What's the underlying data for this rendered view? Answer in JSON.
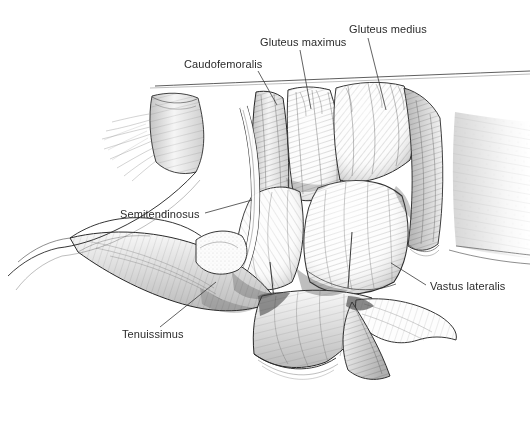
{
  "figure": {
    "medium": "pen-and-ink anatomical illustration",
    "background_color": "#ffffff",
    "ink_color": "#2a2a2a",
    "label_color": "#2b2b2b",
    "label_font_size_px": 11,
    "canvas": {
      "width": 530,
      "height": 421
    }
  },
  "labels": [
    {
      "id": "caudofemoralis",
      "text": "Caudofemoralis",
      "text_x": 184,
      "text_y": 68,
      "anchor": "start",
      "leader": "M258,71 L277,105",
      "target_structure": "caudofemoralis muscle belly"
    },
    {
      "id": "gluteus-maximus",
      "text": "Gluteus maximus",
      "text_x": 260,
      "text_y": 46,
      "anchor": "start",
      "leader": "M300,50 L311,109",
      "target_structure": "gluteus maximus muscle belly"
    },
    {
      "id": "gluteus-medius",
      "text": "Gluteus medius",
      "text_x": 349,
      "text_y": 33,
      "anchor": "start",
      "leader": "M368,38 L386,110",
      "target_structure": "gluteus medius muscle belly"
    },
    {
      "id": "semitendinosus",
      "text": "Semitendinosus",
      "text_x": 120,
      "text_y": 218,
      "anchor": "start",
      "leader": "M205,213 L252,200",
      "target_structure": "semitendinosus muscle"
    },
    {
      "id": "tenuissimus",
      "text": "Tenuissimus",
      "text_x": 122,
      "text_y": 338,
      "anchor": "start",
      "leader": "M160,327 L216,282",
      "target_structure": "tenuissimus muscle strap"
    },
    {
      "id": "vastus-lateralis",
      "text": "Vastus lateralis",
      "text_x": 430,
      "text_y": 290,
      "anchor": "start",
      "leader": "M426,285 L391,263",
      "target_structure": "vastus lateralis muscle"
    }
  ]
}
